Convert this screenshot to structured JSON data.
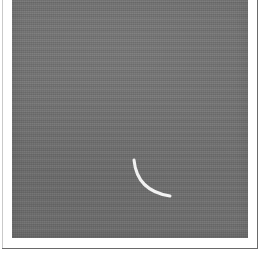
{
  "image": {
    "kind": "scanned-grayscale-photograph",
    "caption_text": "",
    "width_px": 263,
    "height_px": 253,
    "background_color": "#ffffff",
    "plate": {
      "name": "gray-photographic-plate",
      "fill_color": "#6f6f6f",
      "left_px": 12,
      "top_px": 0,
      "width_px": 236,
      "height_px": 238
    },
    "frame": {
      "rule_color": "#6a6a6a",
      "right_rule_x_px": 257,
      "bottom_rule_y_px": 248,
      "left_rule_color": "#c9c9c9"
    },
    "marking": {
      "name": "white-arc-curve",
      "shape": "concave-quarter-arc",
      "stroke_color": "#f2f2f2",
      "stroke_width_px": 3,
      "start_point_px": [
        134,
        160
      ],
      "end_point_px": [
        170,
        196
      ],
      "control_point_px": [
        137,
        191
      ]
    }
  }
}
